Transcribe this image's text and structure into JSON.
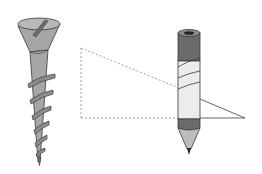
{
  "diagram": {
    "colors": {
      "background": "#ffffff",
      "metal": "#a6a6a6",
      "metal_dark": "#6e6e6e",
      "metal_light": "#c4c4c4",
      "outline": "#3a3a3a",
      "pencil_band": "#6b6b6b",
      "pencil_paper": "#ececec",
      "pencil_wood": "#bdbdbd",
      "lead": "#222222",
      "dashed_line": "#8c8c8c",
      "triangle_line": "#555555"
    },
    "elements": [
      {
        "name": "screw",
        "label": ""
      },
      {
        "name": "dashed-triangle-guide",
        "label": ""
      },
      {
        "name": "pencil",
        "label": ""
      },
      {
        "name": "paper-triangle",
        "label": ""
      }
    ]
  }
}
